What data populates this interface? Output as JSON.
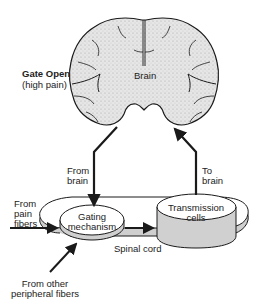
{
  "diagram": {
    "title_state": "Gate Open",
    "title_subtitle": "(high pain)",
    "brain_label": "Brain",
    "from_brain_line1": "From",
    "from_brain_line2": "brain",
    "to_brain_line1": "To",
    "to_brain_line2": "brain",
    "pain_fibers_line1": "From",
    "pain_fibers_line2": "pain",
    "pain_fibers_line3": "fibers",
    "gating_line1": "Gating",
    "gating_line2": "mechanism",
    "transmission_line1": "Transmission",
    "transmission_line2": "cells",
    "spinal_cord": "Spinal cord",
    "peripheral_line1": "From other",
    "peripheral_line2": "peripheral fibers"
  },
  "colors": {
    "ink": "#1a1a1a",
    "brain_fill": "#dcdcdc",
    "disc_side": "#cfcfcf",
    "disc_top": "#ffffff"
  }
}
